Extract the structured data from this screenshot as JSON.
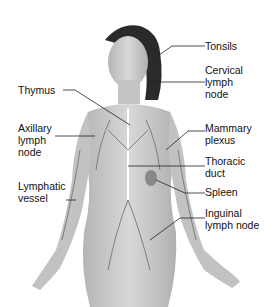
{
  "figure": {
    "colors": {
      "skin": "#c9c9c9",
      "hair": "#2a2a2a",
      "vessels": "#6a6a6a",
      "leader_lines": "#222222",
      "background": "#ffffff"
    }
  },
  "labels": {
    "tonsils": "Tonsils",
    "cervical": "Cervical\nlymph\nnode",
    "thymus": "Thymus",
    "axillary": "Axillary\nlymph\nnode",
    "mammary": "Mammary\nplexus",
    "thoracic": "Thoracic\nduct",
    "lymphatic": "Lymphatic\nvessel",
    "spleen": "Spleen",
    "inguinal": "Inguinal\nlymph node"
  }
}
